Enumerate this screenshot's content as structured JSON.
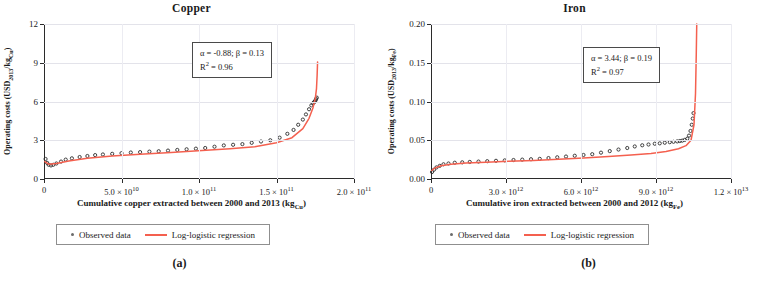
{
  "figure": {
    "panels": [
      {
        "key": "copper",
        "title": "Copper",
        "subfig_label": "(a)",
        "annotation": {
          "line1_pre": "α = -0.88; β = 0.13",
          "line2_pre": "R",
          "line2_sup": "2",
          "line2_post": " = 0.96",
          "alpha": -0.88,
          "beta": 0.13,
          "r_squared": 0.96
        },
        "legend": {
          "observed_label": "Observed data",
          "regression_label": "Log-logistic regression"
        },
        "chart": {
          "type": "scatter",
          "title": "Copper",
          "xlabel_pre": "Cumulative copper extracted between 2000 and 2013 (kg",
          "xlabel_sub": "Cu",
          "xlabel_post": ")",
          "ylabel_pre": "Operating costs (USD",
          "ylabel_sub1": "2013",
          "ylabel_mid": "/kg",
          "ylabel_sub2": "Cu",
          "ylabel_post": ")",
          "xlim": [
            0,
            200000000000
          ],
          "ylim": [
            0,
            12
          ],
          "xticks": [
            {
              "value": 0,
              "mantissa": "0",
              "exponent": ""
            },
            {
              "value": 50000000000,
              "mantissa": "5.0 × 10",
              "exponent": "10"
            },
            {
              "value": 100000000000,
              "mantissa": "1.0 × 10",
              "exponent": "11"
            },
            {
              "value": 150000000000,
              "mantissa": "1.5 × 10",
              "exponent": "11"
            },
            {
              "value": 200000000000,
              "mantissa": "2.0 × 10",
              "exponent": "11"
            }
          ],
          "yticks": [
            {
              "value": 0,
              "label": "0"
            },
            {
              "value": 3,
              "label": "3"
            },
            {
              "value": 6,
              "label": "6"
            },
            {
              "value": 9,
              "label": "9"
            },
            {
              "value": 12,
              "label": "12"
            }
          ],
          "grid": true,
          "series": [
            {
              "name": "Observed data",
              "marker": "circle",
              "color": "#2d2d2d",
              "x": [
                1000000000,
                2000000000,
                3000000000,
                4500000000,
                6000000000,
                8000000000,
                11000000000,
                14000000000,
                18000000000,
                23000000000,
                28000000000,
                33000000000,
                38000000000,
                44000000000,
                50000000000,
                56000000000,
                62000000000,
                68000000000,
                74000000000,
                80000000000,
                86000000000,
                92000000000,
                98000000000,
                104000000000,
                110000000000,
                116000000000,
                122000000000,
                128000000000,
                134000000000,
                140000000000,
                146000000000,
                152000000000,
                157000000000,
                161000000000,
                164000000000,
                167000000000,
                169000000000,
                171000000000,
                172500000000,
                173500000000,
                174200000000,
                174800000000,
                175200000000,
                175600000000,
                176000000000
              ],
              "y": [
                1.55,
                1.25,
                1.1,
                1.05,
                1.1,
                1.2,
                1.35,
                1.5,
                1.6,
                1.7,
                1.78,
                1.85,
                1.9,
                1.95,
                2.0,
                2.05,
                2.08,
                2.12,
                2.15,
                2.2,
                2.25,
                2.3,
                2.35,
                2.4,
                2.5,
                2.6,
                2.65,
                2.7,
                2.8,
                2.9,
                3.0,
                3.2,
                3.5,
                3.8,
                4.2,
                4.6,
                5.0,
                5.4,
                5.7,
                5.85,
                5.95,
                6.0,
                6.1,
                6.2,
                6.3
              ]
            },
            {
              "name": "Log-logistic regression",
              "marker": "line",
              "color": "#f4604f",
              "x": [
                500000000,
                3000000000,
                8000000000,
                16000000000,
                28000000000,
                44000000000,
                62000000000,
                82000000000,
                102000000000,
                120000000000,
                136000000000,
                150000000000,
                160000000000,
                167000000000,
                171000000000,
                173500000000,
                175000000000,
                175800000000,
                176200000000,
                176400000000,
                176500000000
              ],
              "y": [
                1.35,
                1.15,
                1.2,
                1.4,
                1.6,
                1.78,
                1.92,
                2.05,
                2.2,
                2.35,
                2.5,
                2.8,
                3.2,
                3.9,
                4.7,
                5.5,
                6.2,
                7.0,
                8.0,
                8.7,
                9.05
              ]
            }
          ]
        }
      },
      {
        "key": "iron",
        "title": "Iron",
        "subfig_label": "(b)",
        "annotation": {
          "line1_pre": "α = 3.44; β = 0.19",
          "line2_pre": "R",
          "line2_sup": "2",
          "line2_post": " = 0.97",
          "alpha": 3.44,
          "beta": 0.19,
          "r_squared": 0.97
        },
        "legend": {
          "observed_label": "Observed data",
          "regression_label": "Log-logistic regression"
        },
        "chart": {
          "type": "scatter",
          "title": "Iron",
          "xlabel_pre": "Cumulative iron extracted between 2000 and 2012 (kg",
          "xlabel_sub": "Fe",
          "xlabel_post": ")",
          "ylabel_pre": "Operating costs (USD",
          "ylabel_sub1": "2013",
          "ylabel_mid": "/kg",
          "ylabel_sub2": "Fe",
          "ylabel_post": ")",
          "xlim": [
            0,
            12000000000000
          ],
          "ylim": [
            0,
            0.2
          ],
          "xticks": [
            {
              "value": 0,
              "mantissa": "0",
              "exponent": ""
            },
            {
              "value": 3000000000000,
              "mantissa": "3.0 × 10",
              "exponent": "12"
            },
            {
              "value": 6000000000000,
              "mantissa": "6.0 × 10",
              "exponent": "12"
            },
            {
              "value": 9000000000000,
              "mantissa": "9.0 × 10",
              "exponent": "12"
            },
            {
              "value": 12000000000000,
              "mantissa": "1.2 × 10",
              "exponent": "13"
            }
          ],
          "yticks": [
            {
              "value": 0,
              "label": "0.00"
            },
            {
              "value": 0.05,
              "label": "0.05"
            },
            {
              "value": 0.1,
              "label": "0.10"
            },
            {
              "value": 0.15,
              "label": "0.15"
            },
            {
              "value": 0.2,
              "label": "0.20"
            }
          ],
          "grid": true,
          "series": [
            {
              "name": "Observed data",
              "marker": "circle",
              "color": "#2d2d2d",
              "x": [
                40000000000,
                120000000000,
                220000000000,
                350000000000,
                500000000000,
                700000000000,
                950000000000,
                1250000000000,
                1550000000000,
                1900000000000,
                2250000000000,
                2600000000000,
                2950000000000,
                3300000000000,
                3650000000000,
                4000000000000,
                4350000000000,
                4700000000000,
                5050000000000,
                5400000000000,
                5750000000000,
                6100000000000,
                6450000000000,
                6800000000000,
                7150000000000,
                7500000000000,
                7850000000000,
                8150000000000,
                8450000000000,
                8700000000000,
                8950000000000,
                9150000000000,
                9350000000000,
                9550000000000,
                9700000000000,
                9850000000000,
                9950000000000,
                10050000000000,
                10150000000000,
                10250000000000,
                10320000000000,
                10380000000000,
                10430000000000,
                10470000000000,
                10500000000000
              ],
              "y": [
                0.009,
                0.012,
                0.015,
                0.017,
                0.019,
                0.02,
                0.021,
                0.0215,
                0.022,
                0.0225,
                0.023,
                0.0235,
                0.024,
                0.0245,
                0.025,
                0.0255,
                0.026,
                0.027,
                0.028,
                0.029,
                0.03,
                0.031,
                0.032,
                0.034,
                0.036,
                0.038,
                0.04,
                0.042,
                0.0435,
                0.0445,
                0.0455,
                0.046,
                0.0468,
                0.0475,
                0.048,
                0.0485,
                0.049,
                0.0495,
                0.0505,
                0.052,
                0.056,
                0.062,
                0.07,
                0.078,
                0.085
              ]
            },
            {
              "name": "Log-logistic regression",
              "marker": "line",
              "color": "#f4604f",
              "x": [
                30000000000,
                150000000000,
                400000000000,
                800000000000,
                1400000000000,
                2200000000000,
                3100000000000,
                4100000000000,
                5100000000000,
                6100000000000,
                7100000000000,
                8000000000000,
                8800000000000,
                9400000000000,
                9900000000000,
                10200000000000,
                10400000000000,
                10520000000000,
                10580000000000,
                10610000000000,
                10630000000000
              ],
              "y": [
                0.011,
                0.014,
                0.017,
                0.019,
                0.0205,
                0.0215,
                0.0228,
                0.024,
                0.0255,
                0.027,
                0.029,
                0.031,
                0.033,
                0.0355,
                0.039,
                0.043,
                0.05,
                0.07,
                0.11,
                0.16,
                0.2
              ]
            }
          ]
        }
      }
    ]
  }
}
